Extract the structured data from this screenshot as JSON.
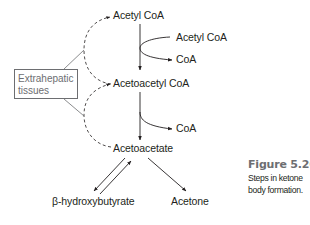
{
  "diagram": {
    "title": "Steps in ketone body formation",
    "nodes": {
      "acetyl_coa": "Acetyl CoA",
      "acetyl_coa_input": "Acetyl CoA",
      "coa_release_1": "CoA",
      "acetoacetyl_coa": "Acetoacetyl CoA",
      "coa_release_2": "CoA",
      "acetoacetate": "Acetoacetate",
      "beta_hydroxybutyrate": "β-hydroxybutyrate",
      "acetone": "Acetone"
    },
    "box": {
      "label": "Extrahepatic\ntissues"
    },
    "edges": [
      {
        "from": "Acetyl CoA",
        "to": "Acetoacetyl CoA",
        "type": "solid-arrow",
        "side_in": "Acetyl CoA",
        "side_out": "CoA"
      },
      {
        "from": "Acetoacetyl CoA",
        "to": "Acetoacetate",
        "type": "solid-arrow",
        "side_out": "CoA"
      },
      {
        "from": "Acetoacetate",
        "to": "β-hydroxybutyrate",
        "type": "reversible"
      },
      {
        "from": "Acetoacetate",
        "to": "Acetone",
        "type": "solid-arrow"
      },
      {
        "from": "Acetoacetyl CoA",
        "to": "Acetyl CoA",
        "type": "dashed-arrow",
        "via": "Extrahepatic tissues"
      },
      {
        "from": "Acetoacetate",
        "to": "Acetoacetyl CoA",
        "type": "dashed-arrow",
        "via": "Extrahepatic tissues"
      }
    ],
    "colors": {
      "line": "#231f20",
      "box_border": "#6d6e71",
      "caption_title": "#6d6e71"
    }
  },
  "figure": {
    "number": "Figure 5.26",
    "caption": "Steps in ketone body formation."
  }
}
